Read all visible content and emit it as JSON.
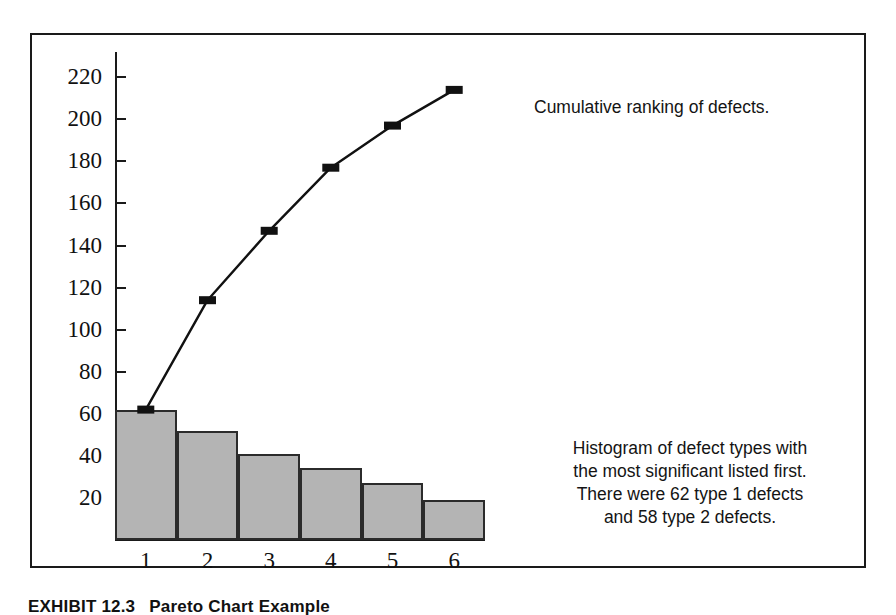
{
  "caption": {
    "label": "EXHIBIT 12.3",
    "text": "Pareto Chart Example"
  },
  "annotations": {
    "cumulative": [
      "Cumulative ranking of defects."
    ],
    "histogram": [
      "Histogram of defect types with",
      "the most significant listed first.",
      "There were 62 type 1 defects",
      "and 58 type 2 defects."
    ]
  },
  "colors": {
    "bar_fill": "#b4b4b4",
    "bar_stroke": "#2b2b2b",
    "line": "#111111",
    "marker": "#111111",
    "axis": "#1a1a1a",
    "frame": "#1a1a1a",
    "text": "#111111",
    "background": "#ffffff"
  },
  "chart_data": {
    "type": "bar",
    "title": "",
    "xlabel": "",
    "ylabel": "",
    "categories": [
      "1",
      "2",
      "3",
      "4",
      "5",
      "6"
    ],
    "yticks": [
      20,
      40,
      60,
      80,
      100,
      120,
      140,
      160,
      180,
      200,
      220
    ],
    "ylim": [
      0,
      232
    ],
    "grid": false,
    "legend": "none",
    "series": [
      {
        "name": "Defect count",
        "type": "bar",
        "values": [
          62,
          52,
          41,
          34,
          27,
          19
        ]
      },
      {
        "name": "Cumulative ranking of defects",
        "type": "line",
        "values": [
          62,
          114,
          147,
          177,
          197,
          214
        ]
      }
    ]
  }
}
